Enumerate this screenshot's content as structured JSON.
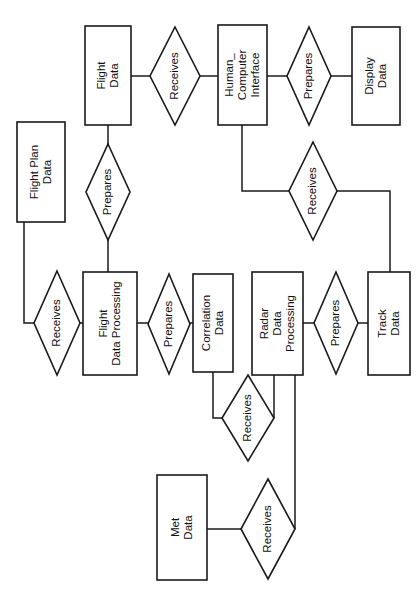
{
  "diagram": {
    "type": "entity-relationship-diagram",
    "orientation": "rotated-90-ccw",
    "background_color": "#ffffff",
    "line_color": "#1a1a1a",
    "entities": [
      {
        "id": "flight-data",
        "lines": [
          "Flight",
          "Data"
        ],
        "x": 85,
        "y": 26,
        "w": 46,
        "h": 99
      },
      {
        "id": "flight-plan-data",
        "lines": [
          "Flight Plan",
          "Data"
        ],
        "x": 17,
        "y": 122,
        "w": 48,
        "h": 100
      },
      {
        "id": "human-computer-interface",
        "lines": [
          "Human_",
          "Computer",
          "Interface"
        ],
        "x": 218,
        "y": 25,
        "w": 49,
        "h": 100
      },
      {
        "id": "display-data",
        "lines": [
          "Display",
          "Data"
        ],
        "x": 352,
        "y": 27,
        "w": 48,
        "h": 98
      },
      {
        "id": "flight-data-processing",
        "lines": [
          "Flight",
          "Data Processing"
        ],
        "x": 83,
        "y": 272,
        "w": 54,
        "h": 103
      },
      {
        "id": "correlation-data",
        "lines": [
          "Correlation",
          "Data"
        ],
        "x": 193,
        "y": 274,
        "w": 40,
        "h": 98
      },
      {
        "id": "radar-data-processing",
        "lines": [
          "Radar",
          "Data",
          "Processing"
        ],
        "x": 252,
        "y": 272,
        "w": 51,
        "h": 103
      },
      {
        "id": "track-data",
        "lines": [
          "Track",
          "Data"
        ],
        "x": 368,
        "y": 272,
        "w": 42,
        "h": 103
      },
      {
        "id": "met-data",
        "lines": [
          "Met",
          "Data"
        ],
        "x": 157,
        "y": 475,
        "w": 50,
        "h": 105
      }
    ],
    "relationships": [
      {
        "id": "rel-receives-flightdata-hci",
        "label": "Receives",
        "cx": 175,
        "cy": 76,
        "rx": 25,
        "ry": 49
      },
      {
        "id": "rel-prepares-flightdata",
        "label": "Prepares",
        "cx": 108,
        "cy": 192,
        "rx": 22,
        "ry": 48
      },
      {
        "id": "rel-prepares-hci-display",
        "label": "Prepares",
        "cx": 309,
        "cy": 76,
        "rx": 22,
        "ry": 49
      },
      {
        "id": "rel-receives-hci-track",
        "label": "Receives",
        "cx": 313,
        "cy": 191,
        "rx": 24,
        "ry": 49
      },
      {
        "id": "rel-receives-flightplan-fdp",
        "label": "Receives",
        "cx": 57,
        "cy": 323,
        "rx": 23,
        "ry": 52
      },
      {
        "id": "rel-prepares-fdp-correlation",
        "label": "Prepares",
        "cx": 169,
        "cy": 324,
        "rx": 21,
        "ry": 50
      },
      {
        "id": "rel-prepares-rdp-track",
        "label": "Prepares",
        "cx": 336,
        "cy": 323,
        "rx": 22,
        "ry": 51
      },
      {
        "id": "rel-receives-correlation-rdp",
        "label": "Receives",
        "cx": 248,
        "cy": 418,
        "rx": 26,
        "ry": 43
      },
      {
        "id": "rel-receives-met-rdp",
        "label": "Receives",
        "cx": 268,
        "cy": 529,
        "rx": 27,
        "ry": 50
      }
    ],
    "connections": [
      {
        "id": "c-flightdata-receives",
        "from": "flight-data",
        "to": "rel-receives-flightdata-hci",
        "path": "M131 76 L150 76"
      },
      {
        "id": "c-receives-hci",
        "from": "rel-receives-flightdata-hci",
        "to": "human-computer-interface",
        "path": "M200 76 L218 76"
      },
      {
        "id": "c-flightdata-prepares",
        "from": "flight-data",
        "to": "rel-prepares-flightdata",
        "path": "M108 125 L108 144"
      },
      {
        "id": "c-prepares-fdp",
        "from": "rel-prepares-flightdata",
        "to": "flight-data-processing",
        "path": "M108 240 L108 272"
      },
      {
        "id": "c-hci-prepares2",
        "from": "human-computer-interface",
        "to": "rel-prepares-hci-display",
        "path": "M267 76 L287 76"
      },
      {
        "id": "c-prepares2-display",
        "from": "rel-prepares-hci-display",
        "to": "display-data",
        "path": "M331 76 L352 76"
      },
      {
        "id": "c-hci-receives2",
        "from": "human-computer-interface",
        "to": "rel-receives-hci-track",
        "path": "M242 125 L242 191 L289 191"
      },
      {
        "id": "c-receives2-track",
        "from": "rel-receives-hci-track",
        "to": "track-data",
        "path": "M337 191 L390 191 L390 272"
      },
      {
        "id": "c-flightplan-receives3",
        "from": "flight-plan-data",
        "to": "rel-receives-flightplan-fdp",
        "path": "M24 222 L24 323 L34 323"
      },
      {
        "id": "c-receives3-fdp",
        "from": "rel-receives-flightplan-fdp",
        "to": "flight-data-processing",
        "path": "M80 323 L83 323"
      },
      {
        "id": "c-fdp-prepares3",
        "from": "flight-data-processing",
        "to": "rel-prepares-fdp-correlation",
        "path": "M137 323 L148 323"
      },
      {
        "id": "c-prepares3-correlation",
        "from": "rel-prepares-fdp-correlation",
        "to": "correlation-data",
        "path": "M190 323 L193 323"
      },
      {
        "id": "c-correlation-receives4",
        "from": "correlation-data",
        "to": "rel-receives-correlation-rdp",
        "path": "M213 372 L213 418 L222 418"
      },
      {
        "id": "c-receives4-rdp",
        "from": "rel-receives-correlation-rdp",
        "to": "radar-data-processing",
        "path": "M274 418 L274 375"
      },
      {
        "id": "c-rdp-prepares4",
        "from": "radar-data-processing",
        "to": "rel-prepares-rdp-track",
        "path": "M303 323 L314 323"
      },
      {
        "id": "c-prepares4-track",
        "from": "rel-prepares-rdp-track",
        "to": "track-data",
        "path": "M358 323 L368 323"
      },
      {
        "id": "c-met-receives5",
        "from": "met-data",
        "to": "rel-receives-met-rdp",
        "path": "M207 529 L241 529"
      },
      {
        "id": "c-receives5-rdp",
        "from": "rel-receives-met-rdp",
        "to": "radar-data-processing",
        "path": "M295 529 L295 375"
      }
    ]
  }
}
